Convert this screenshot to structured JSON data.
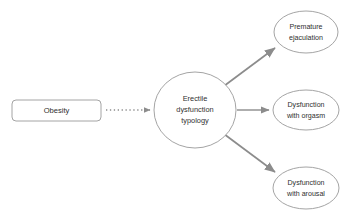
{
  "diagram": {
    "type": "path-diagram",
    "background_color": "#ffffff",
    "nodes": [
      {
        "id": "obesity",
        "label": "Obesity",
        "shape": "rounded-rectangle",
        "stroke_color": "#9a9a9a",
        "fill_color": "#ffffff",
        "text_color": "#2f2f2f",
        "x": 12,
        "y": 100,
        "width": 89,
        "height": 21,
        "lines": [
          "Obesity"
        ]
      },
      {
        "id": "erectile-dysfunction-typology",
        "label": "Erectile dysfunction typology",
        "shape": "ellipse",
        "stroke_color": "#9a9a9a",
        "fill_color": "#ffffff",
        "text_color": "#2f2f2f",
        "cx": 195,
        "cy": 110,
        "rx": 41,
        "ry": 38,
        "lines": [
          "Erectile",
          "dysfunction",
          "typology"
        ]
      },
      {
        "id": "premature-ejaculation",
        "label": "Premature ejaculation",
        "shape": "ellipse",
        "stroke_color": "#9a9a9a",
        "fill_color": "#ffffff",
        "text_color": "#2f2f2f",
        "cx": 306,
        "cy": 32,
        "rx": 32,
        "ry": 21,
        "lines": [
          "Premature",
          "ejaculation"
        ]
      },
      {
        "id": "dysfunction-with-orgasm",
        "label": "Dysfunction with orgasm",
        "shape": "ellipse",
        "stroke_color": "#9a9a9a",
        "fill_color": "#ffffff",
        "text_color": "#2f2f2f",
        "cx": 306,
        "cy": 110,
        "rx": 33,
        "ry": 20,
        "lines": [
          "Dysfunction",
          "with orgasm"
        ]
      },
      {
        "id": "dysfunction-with-arousal",
        "label": "Dysfunction with arousal",
        "shape": "ellipse",
        "stroke_color": "#9a9a9a",
        "fill_color": "#ffffff",
        "text_color": "#2f2f2f",
        "cx": 306,
        "cy": 188,
        "rx": 33,
        "ry": 21,
        "lines": [
          "Dysfunction",
          "with arousal"
        ]
      }
    ],
    "edges": [
      {
        "id": "obesity-to-typology",
        "from": "obesity",
        "to": "erectile-dysfunction-typology",
        "style": "dotted",
        "color": "#8c8c8c",
        "arrowhead": true,
        "x1": 106,
        "y1": 110,
        "x2": 153,
        "y2": 110
      },
      {
        "id": "typology-to-premature-ejaculation",
        "from": "erectile-dysfunction-typology",
        "to": "premature-ejaculation",
        "style": "solid",
        "color": "#8c8c8c",
        "arrowhead": true,
        "x1": 224,
        "y1": 85,
        "x2": 277,
        "y2": 46
      },
      {
        "id": "typology-to-dysfunction-with-orgasm",
        "from": "erectile-dysfunction-typology",
        "to": "dysfunction-with-orgasm",
        "style": "solid",
        "color": "#8c8c8c",
        "arrowhead": true,
        "x1": 237,
        "y1": 110,
        "x2": 271,
        "y2": 110
      },
      {
        "id": "typology-to-dysfunction-with-arousal",
        "from": "erectile-dysfunction-typology",
        "to": "dysfunction-with-arousal",
        "style": "solid",
        "color": "#8c8c8c",
        "arrowhead": true,
        "x1": 224,
        "y1": 135,
        "x2": 277,
        "y2": 174
      }
    ]
  }
}
